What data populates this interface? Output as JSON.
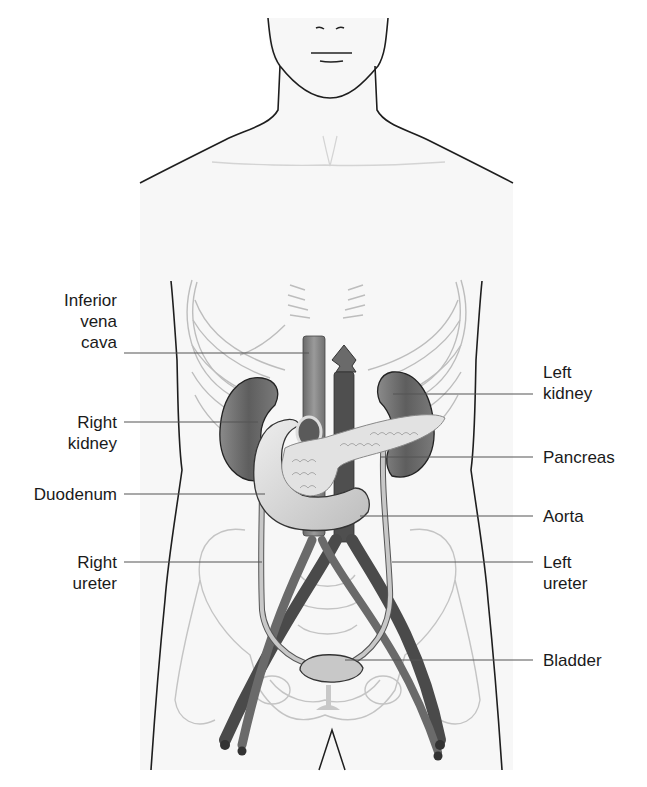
{
  "diagram": {
    "labels_left": [
      {
        "id": "inferior-vena-cava",
        "lines": [
          "Inferior",
          "vena",
          "cava"
        ]
      },
      {
        "id": "right-kidney",
        "lines": [
          "Right",
          "kidney"
        ]
      },
      {
        "id": "duodenum",
        "lines": [
          "Duodenum"
        ]
      },
      {
        "id": "right-ureter",
        "lines": [
          "Right",
          "ureter"
        ]
      }
    ],
    "labels_right": [
      {
        "id": "left-kidney",
        "lines": [
          "Left",
          "kidney"
        ]
      },
      {
        "id": "pancreas",
        "lines": [
          "Pancreas"
        ]
      },
      {
        "id": "aorta",
        "lines": [
          "Aorta"
        ]
      },
      {
        "id": "left-ureter",
        "lines": [
          "Left",
          "ureter"
        ]
      },
      {
        "id": "bladder",
        "lines": [
          "Bladder"
        ]
      }
    ],
    "colors": {
      "background": "#ffffff",
      "body_fill": "#f7f7f7",
      "outline": "#1e1e1e",
      "skeleton": "#b9b9b9",
      "kidney": "#6e6e6e",
      "vessel_dark": "#4a4a4a",
      "vessel_light": "#8a8a8a",
      "duodenum": "#d8d8d8",
      "pancreas": "#e2e2e2",
      "ureter": "#c4c4c4",
      "bladder": "#c8c8c8",
      "leader_line": "#555555"
    }
  }
}
